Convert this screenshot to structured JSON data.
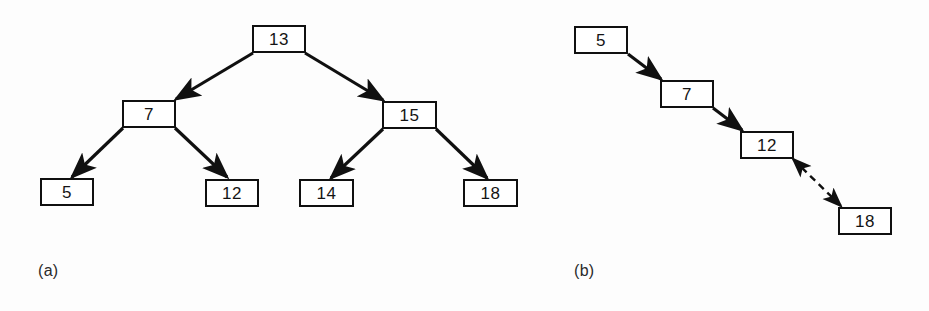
{
  "figure": {
    "background_color": "#fdfdfd",
    "ink_color": "#101010",
    "box_fill_color": "#ffffff"
  },
  "panels": [
    {
      "id": "panel-a",
      "caption": "(a)",
      "caption_position": {
        "x": 38,
        "y": 262
      },
      "structure": "binary-search-tree",
      "nodes": [
        {
          "id": "a-root-13",
          "label": "13",
          "x": 252,
          "y": 25,
          "w": 54,
          "h": 28,
          "level": 0,
          "role": "root"
        },
        {
          "id": "a-7",
          "label": "7",
          "x": 122,
          "y": 100,
          "w": 54,
          "h": 28,
          "level": 1,
          "role": "internal"
        },
        {
          "id": "a-15",
          "label": "15",
          "x": 382,
          "y": 101,
          "w": 55,
          "h": 28,
          "level": 1,
          "role": "internal"
        },
        {
          "id": "a-5",
          "label": "5",
          "x": 40,
          "y": 178,
          "w": 54,
          "h": 28,
          "level": 2,
          "role": "leaf"
        },
        {
          "id": "a-12",
          "label": "12",
          "x": 205,
          "y": 179,
          "w": 54,
          "h": 28,
          "level": 2,
          "role": "leaf"
        },
        {
          "id": "a-14",
          "label": "14",
          "x": 299,
          "y": 179,
          "w": 55,
          "h": 28,
          "level": 2,
          "role": "leaf"
        },
        {
          "id": "a-18",
          "label": "18",
          "x": 463,
          "y": 179,
          "w": 55,
          "h": 28,
          "level": 2,
          "role": "leaf"
        }
      ],
      "edges": [
        {
          "from": "a-root-13",
          "to": "a-7",
          "x1": 253,
          "y1": 53,
          "x2": 176,
          "y2": 99,
          "style": "solid",
          "arrow": "end"
        },
        {
          "from": "a-root-13",
          "to": "a-15",
          "x1": 305,
          "y1": 53,
          "x2": 383,
          "y2": 100,
          "style": "solid",
          "arrow": "end"
        },
        {
          "from": "a-7",
          "to": "a-5",
          "x1": 123,
          "y1": 128,
          "x2": 72,
          "y2": 177,
          "style": "solid",
          "arrow": "end"
        },
        {
          "from": "a-7",
          "to": "a-12",
          "x1": 175,
          "y1": 128,
          "x2": 227,
          "y2": 177,
          "style": "solid",
          "arrow": "end"
        },
        {
          "from": "a-15",
          "to": "a-14",
          "x1": 383,
          "y1": 129,
          "x2": 331,
          "y2": 178,
          "style": "solid",
          "arrow": "end"
        },
        {
          "from": "a-15",
          "to": "a-18",
          "x1": 436,
          "y1": 129,
          "x2": 487,
          "y2": 178,
          "style": "solid",
          "arrow": "end"
        }
      ]
    },
    {
      "id": "panel-b",
      "caption": "(b)",
      "caption_position": {
        "x": 574,
        "y": 262
      },
      "structure": "linked-chain",
      "nodes": [
        {
          "id": "b-5",
          "label": "5",
          "x": 574,
          "y": 26,
          "w": 54,
          "h": 28,
          "index": 0
        },
        {
          "id": "b-7",
          "label": "7",
          "x": 660,
          "y": 80,
          "w": 54,
          "h": 28,
          "index": 1
        },
        {
          "id": "b-12",
          "label": "12",
          "x": 740,
          "y": 131,
          "w": 54,
          "h": 28,
          "index": 2
        },
        {
          "id": "b-18",
          "label": "18",
          "x": 838,
          "y": 207,
          "w": 54,
          "h": 28,
          "index": 3
        }
      ],
      "edges": [
        {
          "from": "b-5",
          "to": "b-7",
          "x1": 628,
          "y1": 54,
          "x2": 661,
          "y2": 79,
          "style": "solid",
          "arrow": "end"
        },
        {
          "from": "b-7",
          "to": "b-12",
          "x1": 713,
          "y1": 108,
          "x2": 742,
          "y2": 130,
          "style": "solid",
          "arrow": "end"
        },
        {
          "from": "b-12",
          "to": "b-18",
          "x1": 793,
          "y1": 159,
          "x2": 841,
          "y2": 206,
          "style": "dashed",
          "arrow": "both"
        }
      ]
    }
  ]
}
